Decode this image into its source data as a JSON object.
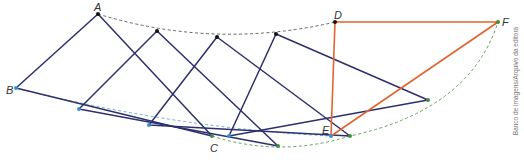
{
  "diagram": {
    "colors": {
      "navy": "#2e2f6e",
      "orange": "#e0642e",
      "blue_dash": "#5aa7d8",
      "green_dash": "#4f9a4a",
      "gray_dash": "#555555",
      "black_point": "#111111",
      "blue_point": "#3b8fd0",
      "green_point": "#3e8e3e"
    },
    "labels": {
      "A": "A",
      "B": "B",
      "C": "C",
      "D": "D",
      "E": "E",
      "F": "F"
    },
    "credit": "Banco de imagens/Arquivo da editora"
  }
}
